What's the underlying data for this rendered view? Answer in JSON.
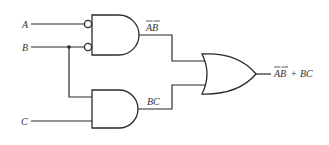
{
  "diagram": {
    "type": "logic-circuit",
    "inputs": [
      {
        "name": "A",
        "label": "A"
      },
      {
        "name": "B",
        "label": "B"
      },
      {
        "name": "C",
        "label": "C"
      }
    ],
    "gates": [
      {
        "id": "and1",
        "type": "AND",
        "inverted_inputs": [
          "A",
          "B"
        ],
        "output_label": "AB",
        "output_label_overline": "each-letter"
      },
      {
        "id": "and2",
        "type": "AND",
        "inputs": [
          "B",
          "C"
        ],
        "output_label": "BC"
      },
      {
        "id": "or1",
        "type": "OR",
        "inputs": [
          "and1",
          "and2"
        ],
        "output_label_term1": "AB",
        "output_label_plus": "+",
        "output_label_term2": "BC"
      }
    ],
    "output_expression": "¬A¬B + BC"
  }
}
